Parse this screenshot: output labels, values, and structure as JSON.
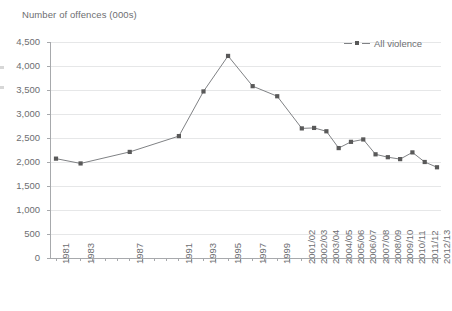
{
  "chart_data": {
    "type": "line",
    "title": "Number of offences (000s)",
    "ylabel": "Number of offences (000s)",
    "xlabel": "",
    "ylim": [
      0,
      4500
    ],
    "ytick_step": 500,
    "ytick_labels": [
      "4,500",
      "4,000",
      "3,500",
      "3,000",
      "2,500",
      "2,000",
      "1,500",
      "1,000",
      "500",
      "0"
    ],
    "ytick_values": [
      4500,
      4000,
      3500,
      3000,
      2500,
      2000,
      1500,
      1000,
      500,
      0
    ],
    "grid": "horizontal",
    "legend_position": "top-right",
    "categories": [
      "1981",
      "1982",
      "1983",
      "1984",
      "1985",
      "1986",
      "1987",
      "1988",
      "1989",
      "1990",
      "1991",
      "1992",
      "1993",
      "1994",
      "1995",
      "1996",
      "1997",
      "1998",
      "1999",
      "2000",
      "2001/02",
      "2002/03",
      "2003/04",
      "2004/05",
      "2005/06",
      "2006/07",
      "2007/08",
      "2008/09",
      "2009/10",
      "2010/11",
      "2011/12",
      "2012/13"
    ],
    "tick_labels_shown": [
      "1981",
      "1983",
      "1987",
      "1991",
      "1993",
      "1995",
      "1997",
      "1999",
      "2001/02",
      "2002/03",
      "2003/04",
      "2004/05",
      "2005/06",
      "2006/07",
      "2007/08",
      "2008/09",
      "2009/10",
      "2010/11",
      "2011/12",
      "2012/13"
    ],
    "series": [
      {
        "name": "All violence",
        "color": "#808285",
        "marker": "square",
        "marker_color": "#595959",
        "points": [
          {
            "x": "1981",
            "y": 2070
          },
          {
            "x": "1983",
            "y": 1970
          },
          {
            "x": "1987",
            "y": 2210
          },
          {
            "x": "1991",
            "y": 2540
          },
          {
            "x": "1993",
            "y": 3470
          },
          {
            "x": "1995",
            "y": 4210
          },
          {
            "x": "1997",
            "y": 3580
          },
          {
            "x": "1999",
            "y": 3370
          },
          {
            "x": "2001/02",
            "y": 2700
          },
          {
            "x": "2002/03",
            "y": 2710
          },
          {
            "x": "2003/04",
            "y": 2640
          },
          {
            "x": "2004/05",
            "y": 2290
          },
          {
            "x": "2005/06",
            "y": 2420
          },
          {
            "x": "2006/07",
            "y": 2470
          },
          {
            "x": "2007/08",
            "y": 2160
          },
          {
            "x": "2008/09",
            "y": 2100
          },
          {
            "x": "2009/10",
            "y": 2060
          },
          {
            "x": "2010/11",
            "y": 2200
          },
          {
            "x": "2011/12",
            "y": 2000
          },
          {
            "x": "2012/13",
            "y": 1890
          }
        ]
      }
    ]
  },
  "legend": {
    "entries": [
      {
        "label": "All violence"
      }
    ]
  }
}
